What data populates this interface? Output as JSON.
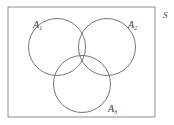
{
  "figure": {
    "kind": "venn-diagram",
    "set_count": 3,
    "background_color": "#ffffff",
    "circle_stroke_color": "#5f5f63",
    "rect_stroke_color": "#8d8d91",
    "label_color": "#3b3b3f"
  },
  "universe": {
    "label": "S",
    "label_x": 163,
    "label_y": 18,
    "rect": {
      "x": 8,
      "y": 7,
      "width": 147,
      "height": 110
    }
  },
  "sets": [
    {
      "name": "A1",
      "label_base": "A",
      "label_sub": "1",
      "label_x": 33,
      "label_y": 28,
      "circle": {
        "cx": 57,
        "cy": 47,
        "r": 28.5
      }
    },
    {
      "name": "A2",
      "label_base": "A",
      "label_sub": "2",
      "label_x": 128,
      "label_y": 28,
      "circle": {
        "cx": 107,
        "cy": 47,
        "r": 28.5
      }
    },
    {
      "name": "A3",
      "label_base": "A",
      "label_sub": "3",
      "label_x": 108,
      "label_y": 112,
      "circle": {
        "cx": 82,
        "cy": 84,
        "r": 28.5
      }
    }
  ]
}
